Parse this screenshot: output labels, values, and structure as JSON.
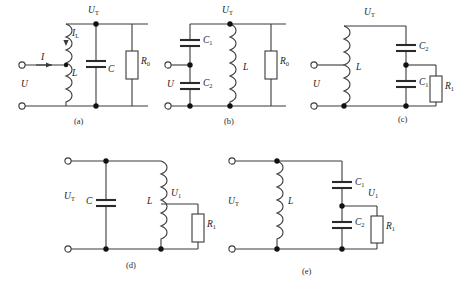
{
  "figure": {
    "type": "circuit-diagram-set",
    "background_color": "#ffffff",
    "line_color": "#3a3a3a",
    "node_color": "#111111"
  },
  "circuits": [
    {
      "id": "a",
      "caption": "(a)",
      "labels": {
        "source": "U",
        "output": "U",
        "output_sub": "T",
        "current_in": "I",
        "current_branch": "I",
        "current_branch_sub": "L",
        "inductor": "L",
        "capacitor": "C",
        "resistor": "R",
        "resistor_sub": "0"
      },
      "components": [
        "L",
        "C",
        "R0"
      ]
    },
    {
      "id": "b",
      "caption": "(b)",
      "labels": {
        "source": "U",
        "output": "U",
        "output_sub": "T",
        "cap_top": "C",
        "cap_top_sub": "1",
        "cap_bottom": "C",
        "cap_bottom_sub": "2",
        "inductor": "L",
        "resistor": "R",
        "resistor_sub": "0"
      },
      "components": [
        "C1",
        "C2",
        "L",
        "R0"
      ]
    },
    {
      "id": "c",
      "caption": "(c)",
      "labels": {
        "source": "U",
        "output": "U",
        "output_sub": "T",
        "inductor": "L",
        "cap_top": "C",
        "cap_top_sub": "2",
        "cap_bottom": "C",
        "cap_bottom_sub": "1",
        "resistor": "R",
        "resistor_sub": "1"
      },
      "components": [
        "L",
        "C2",
        "C1",
        "R1"
      ]
    },
    {
      "id": "d",
      "caption": "(d)",
      "labels": {
        "source": "U",
        "source_sub": "T",
        "capacitor": "C",
        "inductor": "L",
        "output": "U",
        "output_sub": "1",
        "resistor": "R",
        "resistor_sub": "1"
      },
      "components": [
        "C",
        "L",
        "R1"
      ]
    },
    {
      "id": "e",
      "caption": "(e)",
      "labels": {
        "source": "U",
        "source_sub": "T",
        "inductor": "L",
        "cap_top": "C",
        "cap_top_sub": "1",
        "cap_bottom": "C",
        "cap_bottom_sub": "2",
        "output": "U",
        "output_sub": "1",
        "resistor": "R",
        "resistor_sub": "1"
      },
      "components": [
        "L",
        "C1",
        "C2",
        "R1"
      ]
    }
  ]
}
